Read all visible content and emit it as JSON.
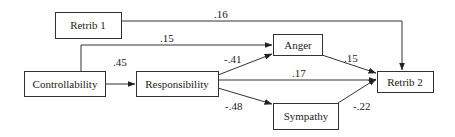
{
  "diagram": {
    "type": "path-model",
    "nodes": {
      "retrib1": {
        "label": "Retrib 1"
      },
      "controllability": {
        "label": "Controllability"
      },
      "responsibility": {
        "label": "Responsibility"
      },
      "anger": {
        "label": "Anger"
      },
      "sympathy": {
        "label": "Sympathy"
      },
      "retrib2": {
        "label": "Retrib 2"
      }
    },
    "edges": {
      "retrib1_retrib2": {
        "from": "Retrib 1",
        "to": "Retrib 2",
        "coef": ".16"
      },
      "controllability_anger": {
        "from": "Controllability",
        "to": "Anger",
        "coef": ".15"
      },
      "controllability_responsibility": {
        "from": "Controllability",
        "to": "Responsibility",
        "coef": ".45"
      },
      "responsibility_anger": {
        "from": "Responsibility",
        "to": "Anger",
        "coef": "-.41"
      },
      "responsibility_retrib2": {
        "from": "Responsibility",
        "to": "Retrib 2",
        "coef": ".17"
      },
      "responsibility_sympathy": {
        "from": "Responsibility",
        "to": "Sympathy",
        "coef": "-.48"
      },
      "anger_retrib2": {
        "from": "Anger",
        "to": "Retrib 2",
        "coef": ".15"
      },
      "sympathy_retrib2": {
        "from": "Sympathy",
        "to": "Retrib 2",
        "coef": "-.22"
      }
    }
  }
}
